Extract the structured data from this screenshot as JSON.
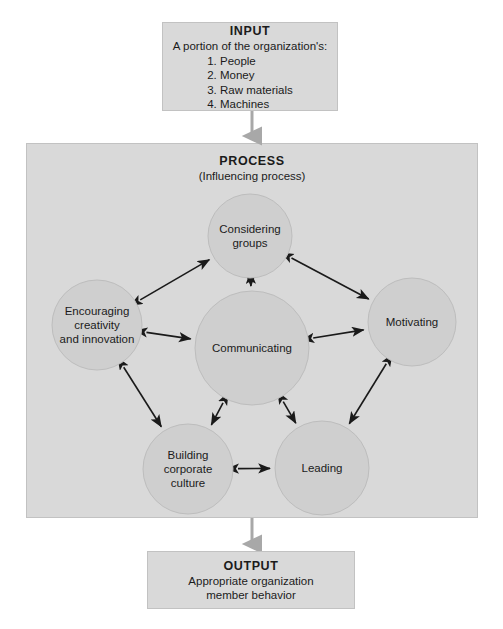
{
  "diagram": {
    "colors": {
      "box_fill": "#d9d9d9",
      "box_border": "#c2c2c2",
      "circle_fill": "#cfcfcf",
      "circle_border": "#bdbdbd",
      "process_fill": "#dcdcdc",
      "arrow": "#1a1a1a",
      "flow_arrow": "#a8a8a8",
      "text": "#1b1b1b"
    },
    "input": {
      "title": "INPUT",
      "subtitle": "A portion of the organization's:",
      "items": [
        "1. People",
        "2. Money",
        "3. Raw materials",
        "4. Machines"
      ]
    },
    "process": {
      "title": "PROCESS",
      "subtitle": "(Influencing process)",
      "nodes": [
        {
          "id": "considering-groups",
          "label": "Considering\ngroups",
          "cx": 250,
          "cy": 236,
          "r": 42
        },
        {
          "id": "encouraging-creativity",
          "label": "Encouraging\ncreativity\nand innovation",
          "cx": 97,
          "cy": 325,
          "r": 45
        },
        {
          "id": "communicating",
          "label": "Communicating",
          "cx": 252,
          "cy": 348,
          "r": 57
        },
        {
          "id": "motivating",
          "label": "Motivating",
          "cx": 412,
          "cy": 322,
          "r": 44
        },
        {
          "id": "building-corporate-culture",
          "label": "Building\ncorporate\nculture",
          "cx": 188,
          "cy": 469,
          "r": 45
        },
        {
          "id": "leading",
          "label": "Leading",
          "cx": 322,
          "cy": 468,
          "r": 47
        }
      ],
      "connections": [
        {
          "from": "encouraging-creativity",
          "to": "considering-groups",
          "double": true
        },
        {
          "from": "considering-groups",
          "to": "motivating",
          "double": true
        },
        {
          "from": "considering-groups",
          "to": "communicating",
          "double": true
        },
        {
          "from": "encouraging-creativity",
          "to": "communicating",
          "double": true
        },
        {
          "from": "communicating",
          "to": "motivating",
          "double": true
        },
        {
          "from": "encouraging-creativity",
          "to": "building-corporate-culture",
          "double": true
        },
        {
          "from": "communicating",
          "to": "building-corporate-culture",
          "double": true
        },
        {
          "from": "communicating",
          "to": "leading",
          "double": true
        },
        {
          "from": "motivating",
          "to": "leading",
          "double": true
        },
        {
          "from": "building-corporate-culture",
          "to": "leading",
          "double": true
        }
      ]
    },
    "output": {
      "title": "OUTPUT",
      "line1": "Appropriate organization",
      "line2": "member behavior"
    },
    "flow_arrows": [
      {
        "id": "input-to-process",
        "x": 252,
        "y1": 111,
        "y2": 143
      },
      {
        "id": "process-to-output",
        "x": 252,
        "y1": 518,
        "y2": 551
      }
    ]
  }
}
